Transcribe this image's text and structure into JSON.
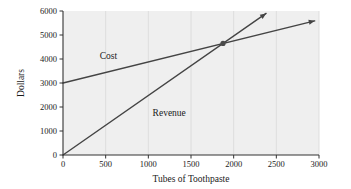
{
  "chart_data": {
    "type": "line",
    "title": "",
    "xlabel": "Tubes of Toothpaste",
    "ylabel": "Dollars",
    "xlim": [
      0,
      3000
    ],
    "ylim": [
      0,
      6000
    ],
    "xticks": [
      0,
      500,
      1000,
      1500,
      2000,
      2500,
      3000
    ],
    "yticks": [
      0,
      1000,
      2000,
      3000,
      4000,
      5000,
      6000
    ],
    "xtick_labels": [
      "0",
      "500",
      "1000",
      "1500",
      "2000",
      "2500",
      "3000"
    ],
    "ytick_labels": [
      "0",
      "1000",
      "2000",
      "3000",
      "4000",
      "5000",
      "6000"
    ],
    "grid": "vertical-only",
    "legend_position": "inline-labels",
    "plot_background": "#efefef",
    "line_color": "#444444",
    "grid_color": "#d8d8d8",
    "axis_color": "#333333",
    "series": [
      {
        "name": "Cost",
        "label": "Cost",
        "label_x": 430,
        "label_y": 3980,
        "color": "#444444",
        "arrow": true,
        "points": [
          {
            "x": 0,
            "y": 3000
          },
          {
            "x": 2950,
            "y": 5590
          }
        ],
        "intercept": 3000,
        "slope": 0.878
      },
      {
        "name": "Revenue",
        "label": "Revenue",
        "label_x": 1050,
        "label_y": 1620,
        "color": "#444444",
        "arrow": true,
        "points": [
          {
            "x": 0,
            "y": 0
          },
          {
            "x": 2380,
            "y": 5900
          }
        ],
        "intercept": 0,
        "slope": 2.479
      }
    ],
    "annotations": [
      {
        "name": "break-even-point",
        "type": "point-marker",
        "x": 1875,
        "y": 4650,
        "color": "#4a4a4a",
        "label": ""
      }
    ]
  }
}
